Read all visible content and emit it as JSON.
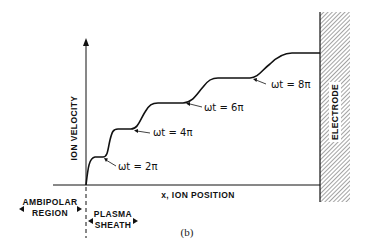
{
  "figure": {
    "caption": "(b)",
    "y_axis_label": "ION VELOCITY",
    "x_axis_label": "x, ION POSITION",
    "electrode_label": "ELECTRODE",
    "regions": {
      "ambipolar_line1": "AMBIPOLAR",
      "ambipolar_line2": "REGION",
      "sheath_line1": "PLASMA",
      "sheath_line2": "SHEATH"
    },
    "annotations": [
      {
        "label": "ωt = 2π"
      },
      {
        "label": "ωt = 4π"
      },
      {
        "label": "ωt = 6π"
      },
      {
        "label": "ωt = 8π"
      }
    ],
    "colors": {
      "line": "#111111",
      "background": "#ffffff"
    }
  }
}
